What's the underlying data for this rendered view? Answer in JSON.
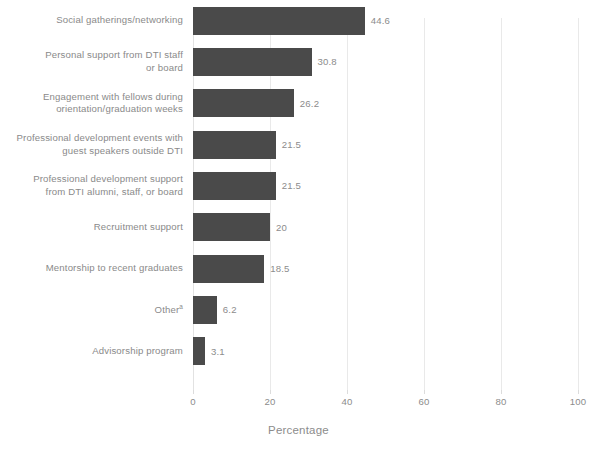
{
  "chart_data": {
    "type": "bar",
    "orientation": "horizontal",
    "title": "",
    "subtitle": "",
    "xlabel": "Percentage",
    "ylabel": "",
    "xlim": [
      0,
      100
    ],
    "xticks": [
      "0",
      "20",
      "40",
      "60",
      "80",
      "100"
    ],
    "grid": true,
    "legend": null,
    "bar_color": "#4a4a4a",
    "label_color": "#8a8a8a",
    "background": "#ffffff",
    "categories": [
      "Social gatherings/networking",
      "Personal support from DTI staff\nor board",
      "Engagement with fellows during\norientation/graduation weeks",
      "Professional development events with\nguest speakers outside DTI",
      "Professional development support\nfrom DTI alumni, staff, or board",
      "Recruitment support",
      "Mentorship to recent graduates",
      "Other",
      "Advisorship program"
    ],
    "category_footnotes": [
      "",
      "",
      "",
      "",
      "",
      "",
      "",
      "a",
      ""
    ],
    "values": [
      44.6,
      30.8,
      26.2,
      21.5,
      21.5,
      20,
      18.5,
      6.2,
      3.1
    ],
    "value_labels": [
      "44.6",
      "30.8",
      "26.2",
      "21.5",
      "21.5",
      "20",
      "18.5",
      "6.2",
      "3.1"
    ]
  }
}
